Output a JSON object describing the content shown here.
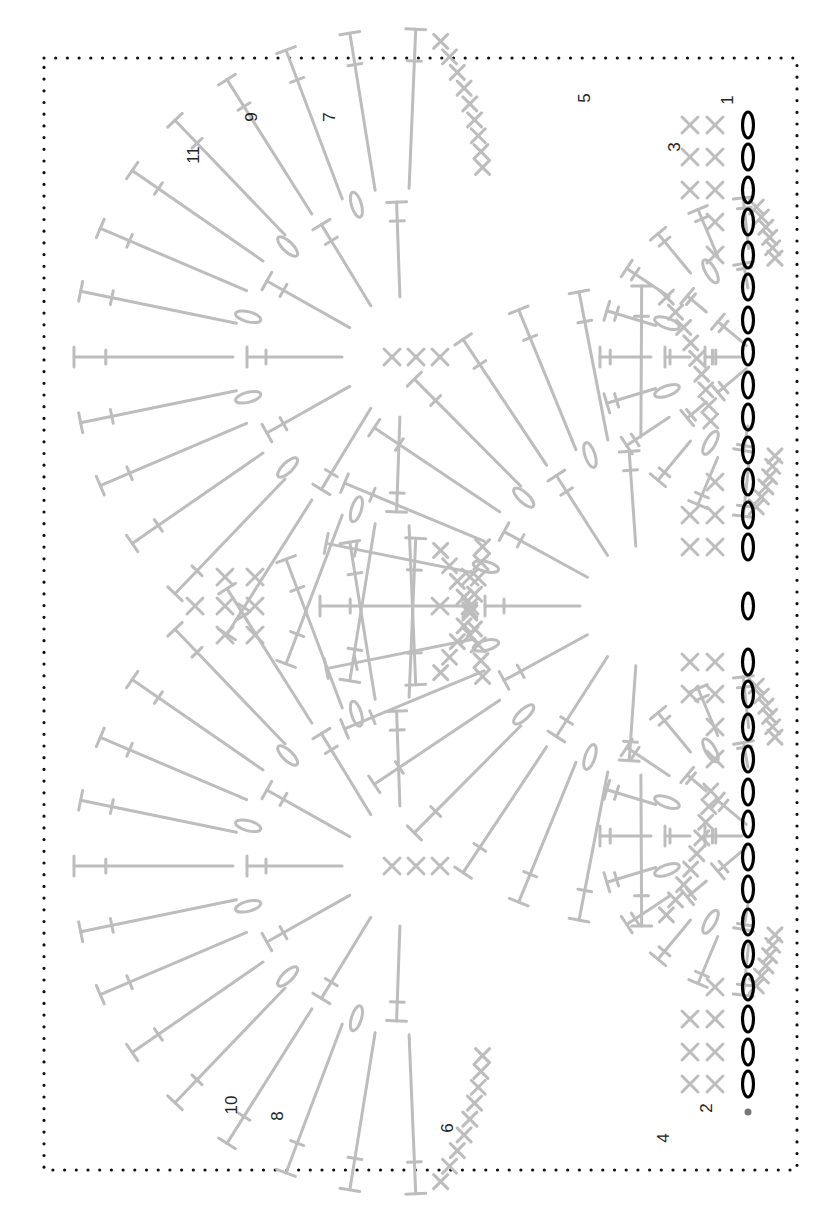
{
  "diagram": {
    "type": "crochet-stitch-chart",
    "orientation": "rotated-90-clockwise",
    "colors": {
      "foundation_chain": "#000000",
      "stitches": "#bdbdbd",
      "labels": "#222222",
      "border": "#111111",
      "background": "#ffffff"
    },
    "border": {
      "x": 44,
      "y": 58,
      "width": 753,
      "height": 1112,
      "style": "dotted"
    },
    "row_labels": [
      {
        "text": "1",
        "x": 733,
        "y": 100
      },
      {
        "text": "2",
        "x": 712,
        "y": 1108
      },
      {
        "text": "3",
        "x": 680,
        "y": 147
      },
      {
        "text": "4",
        "x": 669,
        "y": 1138
      },
      {
        "text": "5",
        "x": 590,
        "y": 98
      },
      {
        "text": "6",
        "x": 453,
        "y": 1128
      },
      {
        "text": "7",
        "x": 335,
        "y": 117
      },
      {
        "text": "8",
        "x": 283,
        "y": 1116
      },
      {
        "text": "9",
        "x": 257,
        "y": 117
      },
      {
        "text": "10",
        "x": 237,
        "y": 1105
      },
      {
        "text": "11",
        "x": 199,
        "y": 155
      }
    ],
    "foundation": {
      "x": 748,
      "chain_y": [
        125,
        157,
        190,
        222,
        255,
        287,
        320,
        352,
        385,
        417,
        450,
        482,
        515,
        547,
        606,
        662,
        694,
        727,
        759,
        792,
        824,
        857,
        889,
        922,
        954,
        987,
        1019,
        1052,
        1084
      ],
      "slip_dot_y": 1112
    },
    "fans": [
      {
        "row": 3,
        "cx": 760,
        "cy": 357,
        "r_inner": 95,
        "r_outer": 160,
        "span": 160
      },
      {
        "row": 3,
        "cx": 760,
        "cy": 836,
        "r_inner": 95,
        "r_outer": 160,
        "span": 160
      },
      {
        "row": 7,
        "cx": 640,
        "cy": 606,
        "r_inner": 155,
        "r_outer": 320,
        "span": 172
      },
      {
        "row": 11,
        "cx": 402,
        "cy": 357,
        "r_inner": 155,
        "r_outer": 328,
        "span": 176
      },
      {
        "row": 11,
        "cx": 402,
        "cy": 866,
        "r_inner": 155,
        "r_outer": 328,
        "span": 176
      }
    ],
    "sc_columns": [
      {
        "x": 715,
        "ys": [
          125,
          157,
          190,
          222,
          255,
          482,
          515,
          547,
          662,
          694,
          727,
          759,
          987,
          1019,
          1052,
          1084
        ]
      },
      {
        "x": 690,
        "ys": [
          125,
          157,
          190,
          515,
          547,
          662,
          694,
          1019,
          1052,
          1084
        ]
      },
      {
        "x": 470,
        "ys": [
          606,
          635,
          577
        ]
      },
      {
        "x": 440,
        "ys": [
          357,
          606,
          866
        ]
      },
      {
        "x": 416,
        "ys": [
          357,
          866
        ]
      },
      {
        "x": 392,
        "ys": [
          357,
          866
        ]
      },
      {
        "x": 255,
        "ys": [
          606,
          577,
          635
        ]
      },
      {
        "x": 225,
        "ys": [
          606,
          577,
          635
        ]
      },
      {
        "x": 195,
        "ys": [
          606
        ]
      }
    ],
    "legend": []
  }
}
